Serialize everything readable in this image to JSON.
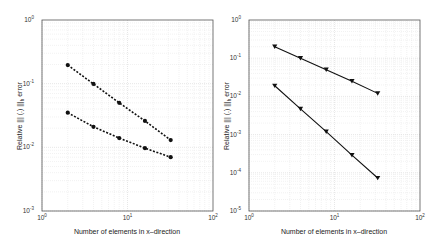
{
  "chart_data": [
    {
      "type": "line",
      "scale": "loglog",
      "title": "",
      "xlabel": "Number of elements in x–direction",
      "ylabel": "Relative ||| (.) |||_h error",
      "xlim": [
        1,
        100
      ],
      "ylim": [
        0.001,
        1
      ],
      "grid": true,
      "x_tick_labels": [
        "10^0",
        "10^1",
        "10^2"
      ],
      "y_tick_labels": [
        "10^0",
        "10^-1",
        "10^-2",
        "10^-3"
      ],
      "x": [
        2,
        4,
        8,
        16,
        32
      ],
      "series": [
        {
          "name": "series-1",
          "style": "dotted",
          "marker": "circle",
          "values": [
            0.196,
            0.099,
            0.05,
            0.026,
            0.013
          ]
        },
        {
          "name": "series-2",
          "style": "dotted",
          "marker": "circle",
          "values": [
            0.035,
            0.021,
            0.014,
            0.0097,
            0.007
          ]
        }
      ]
    },
    {
      "type": "line",
      "scale": "loglog",
      "title": "",
      "xlabel": "Number of elements in x–direction",
      "ylabel": "Relative ||| (.) |||_h error",
      "xlim": [
        1,
        100
      ],
      "ylim": [
        1e-05,
        1
      ],
      "grid": true,
      "x_tick_labels": [
        "10^0",
        "10^1",
        "10^2"
      ],
      "y_tick_labels": [
        "10^0",
        "10^-1",
        "10^-2",
        "10^-3",
        "10^-4",
        "10^-5"
      ],
      "x": [
        2,
        4,
        8,
        16,
        32
      ],
      "series": [
        {
          "name": "series-1",
          "style": "solid",
          "marker": "triangle-down",
          "values": [
            0.2,
            0.1,
            0.05,
            0.025,
            0.012
          ]
        },
        {
          "name": "series-2",
          "style": "solid",
          "marker": "triangle-down",
          "values": [
            0.019,
            0.0047,
            0.0012,
            0.00029,
            7.3e-05
          ]
        }
      ]
    }
  ],
  "left": {
    "xlabel": "Number of elements in x–direction",
    "ylabel_main": "Relative ||| (.) |||",
    "ylabel_sub": "h",
    "ylabel_end": " error"
  },
  "right": {
    "xlabel": "Number of elements in x–direction",
    "ylabel_main": "Relative ||| (.) |||",
    "ylabel_sub": "h",
    "ylabel_end": " error"
  }
}
